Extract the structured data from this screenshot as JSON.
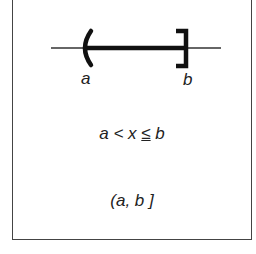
{
  "diagram": {
    "type": "number-line-interval",
    "endpoint_left": {
      "label": "a",
      "symbol": "(",
      "included": false
    },
    "endpoint_right": {
      "label": "b",
      "symbol": "]",
      "included": true
    },
    "inequality": {
      "left": "a",
      "op1": "<",
      "var": "x",
      "op2": "≤",
      "right": "b"
    },
    "interval_notation": "(a, b ]",
    "colors": {
      "line": "#222222",
      "border": "#444444"
    }
  }
}
